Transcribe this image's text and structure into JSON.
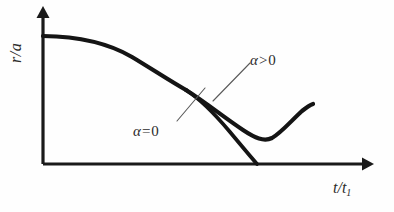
{
  "figure": {
    "kind": "line-plot-schematic",
    "background_color": "#fefefe",
    "ink_color": "#1a1a1a",
    "label_color": "#2b2b2b"
  },
  "axes": {
    "y_label": "r/a",
    "x_label_main": "t/t",
    "x_label_sub": "1",
    "origin_px": [
      43,
      164
    ],
    "x_arrow_tip_px": [
      371,
      164
    ],
    "y_arrow_tip_px": [
      43,
      9
    ],
    "ticks": [],
    "gridlines": false
  },
  "annotations": [
    {
      "name": "alpha-positive",
      "text_alpha": "α",
      "text_operator": ">",
      "text_value": "0",
      "leader_from_px": [
        213,
        101
      ],
      "leader_to_px": [
        250,
        63
      ]
    },
    {
      "name": "alpha-zero",
      "text_alpha": "α",
      "text_operator": "=",
      "text_value": "0",
      "leader_from_px": [
        205,
        88
      ],
      "leader_to_px": [
        177,
        121
      ]
    }
  ],
  "chart_data": {
    "type": "line",
    "title": "",
    "xlabel": "t/t_1",
    "ylabel": "r/a",
    "xlim": [
      0,
      1
    ],
    "ylim": [
      0,
      1
    ],
    "grid": false,
    "legend": "inline-annotations",
    "annotations": [
      "α > 0",
      "α = 0"
    ],
    "series": [
      {
        "name": "alpha = 0",
        "label": "α = 0",
        "comment": "collapses monotonically to zero radius at finite time",
        "x": [
          0.0,
          0.06,
          0.13,
          0.2,
          0.27,
          0.34,
          0.4,
          0.46,
          0.52,
          0.58,
          0.63,
          0.65
        ],
        "y": [
          1.0,
          0.99,
          0.97,
          0.93,
          0.86,
          0.77,
          0.66,
          0.54,
          0.4,
          0.25,
          0.08,
          0.0
        ]
      },
      {
        "name": "alpha > 0",
        "label": "α > 0",
        "comment": "bounces at a finite minimum radius then re-expands",
        "x": [
          0.0,
          0.06,
          0.13,
          0.2,
          0.27,
          0.34,
          0.4,
          0.46,
          0.52,
          0.58,
          0.63,
          0.7,
          0.76,
          0.82,
          0.88,
          0.94,
          1.0
        ],
        "y": [
          1.0,
          0.99,
          0.97,
          0.93,
          0.86,
          0.77,
          0.67,
          0.57,
          0.47,
          0.38,
          0.3,
          0.21,
          0.21,
          0.28,
          0.34,
          0.39,
          0.43
        ]
      }
    ]
  },
  "geometry_px": {
    "curve_common": "M 43 36 C 80 36.5 110 44 132 57 C 152 69 170 81 186 90",
    "curve_alpha_zero": "M 186 90 C 200 99 214 113 230 132 C 240 144 250 156 257 164",
    "curve_alpha_pos": "M 186 90 C 205 102 225 118 243 130 C 255 138 264 142 272 138 C 281 133 292 120 302 111 C 307 107 310 105 313 104"
  }
}
